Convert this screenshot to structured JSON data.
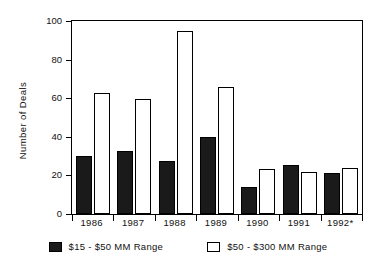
{
  "chart_data": {
    "type": "bar",
    "title": "",
    "xlabel": "",
    "ylabel": "Number of Deals",
    "ylim": [
      0,
      100
    ],
    "yticks": [
      0,
      20,
      40,
      60,
      80,
      100
    ],
    "ytick_labels": [
      "0",
      "20",
      "40",
      "60",
      "80",
      "100"
    ],
    "grid": false,
    "legend_position": "bottom",
    "categories": [
      "1986",
      "1987",
      "1988",
      "1989",
      "1990",
      "1991",
      "1992*"
    ],
    "series": [
      {
        "name": "$15 - $50 MM Range",
        "style": "filled-black",
        "color": "#1a1a1a",
        "values": [
          30,
          32.5,
          27.5,
          40,
          14,
          25.5,
          21
        ]
      },
      {
        "name": "$50 - $300 MM Range",
        "style": "open-white",
        "color": "#ffffff",
        "values": [
          62.5,
          59.5,
          95,
          66,
          23.5,
          22,
          24
        ]
      }
    ]
  },
  "axis": {
    "y_title": "Number of Deals",
    "y_tick_labels": [
      "100",
      "80",
      "60",
      "40",
      "20",
      "0"
    ],
    "x_tick_labels": [
      "1986",
      "1987",
      "1988",
      "1989",
      "1990",
      "1991",
      "1992*"
    ]
  },
  "legend": {
    "entries": [
      {
        "label": "$15 - $50 MM Range",
        "swatch": "filled-black-swatch"
      },
      {
        "label": "$50 - $300 MM Range",
        "swatch": "open-white-swatch"
      }
    ]
  },
  "colors": {
    "axis": "#000000",
    "dark_bar": "#1a1a1a",
    "light_bar": "#ffffff",
    "background": "#ffffff"
  }
}
